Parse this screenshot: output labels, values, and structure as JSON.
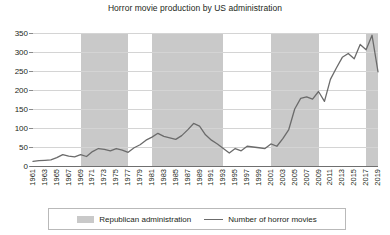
{
  "chart_data": {
    "type": "line",
    "title": "Horror movie production by US administration",
    "xlabel": "",
    "ylabel": "",
    "ylim": [
      0,
      350
    ],
    "yticks": [
      0,
      50,
      100,
      150,
      200,
      250,
      300,
      350
    ],
    "grid": true,
    "legend_position": "bottom",
    "x": [
      1961,
      1962,
      1963,
      1964,
      1965,
      1966,
      1967,
      1968,
      1969,
      1970,
      1971,
      1972,
      1973,
      1974,
      1975,
      1976,
      1977,
      1978,
      1979,
      1980,
      1981,
      1982,
      1983,
      1984,
      1985,
      1986,
      1987,
      1988,
      1989,
      1990,
      1991,
      1992,
      1993,
      1994,
      1995,
      1996,
      1997,
      1998,
      1999,
      2000,
      2001,
      2002,
      2003,
      2004,
      2005,
      2006,
      2007,
      2008,
      2009,
      2010,
      2011,
      2012,
      2013,
      2014,
      2015,
      2016,
      2017,
      2018,
      2019
    ],
    "xtick_labels": [
      "1961",
      "1963",
      "1965",
      "1967",
      "1969",
      "1971",
      "1973",
      "1975",
      "1977",
      "1979",
      "1981",
      "1983",
      "1985",
      "1987",
      "1989",
      "1991",
      "1993",
      "1995",
      "1997",
      "1999",
      "2001",
      "2003",
      "2005",
      "2007",
      "2009",
      "2011",
      "2013",
      "2015",
      "2017",
      "2019"
    ],
    "series": [
      {
        "name": "Number of horror movies",
        "color": "#6b6b6b",
        "values": [
          12,
          14,
          15,
          16,
          22,
          30,
          26,
          24,
          30,
          25,
          38,
          46,
          44,
          40,
          46,
          42,
          36,
          48,
          56,
          68,
          76,
          86,
          78,
          74,
          70,
          80,
          95,
          112,
          105,
          82,
          68,
          58,
          46,
          34,
          46,
          40,
          52,
          50,
          48,
          46,
          58,
          52,
          72,
          96,
          150,
          178,
          182,
          176,
          196,
          170,
          228,
          258,
          286,
          296,
          282,
          320,
          306,
          344,
          248
        ]
      }
    ],
    "bands": [
      {
        "label": "Republican administration",
        "start": 1969,
        "end": 1977
      },
      {
        "label": "Republican administration",
        "start": 1981,
        "end": 1993
      },
      {
        "label": "Republican administration",
        "start": 2001,
        "end": 2009
      },
      {
        "label": "Republican administration",
        "start": 2017,
        "end": 2019.8
      }
    ],
    "band_color": "#c9c9c9"
  },
  "legend": {
    "band_label": "Republican administration",
    "line_label": "Number of horror movies"
  }
}
